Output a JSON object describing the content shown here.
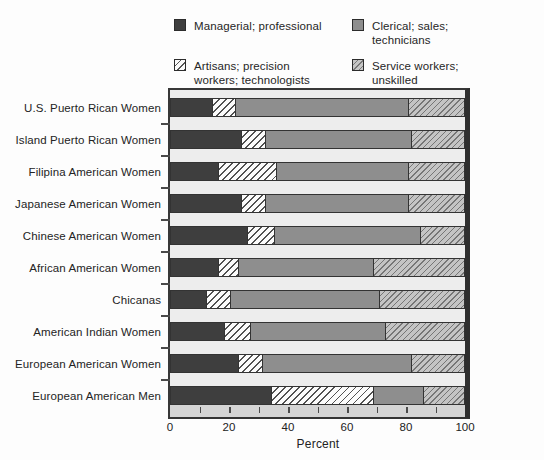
{
  "legend": {
    "items": [
      {
        "key": "managerial",
        "label": "Managerial; professional"
      },
      {
        "key": "clerical",
        "label": "Clerical; sales;\ntechnicians"
      },
      {
        "key": "artisans",
        "label": "Artisans; precision\nworkers; technologists"
      },
      {
        "key": "service",
        "label": "Service workers;\nunskilled"
      }
    ]
  },
  "chart_data": {
    "type": "bar",
    "stacked": true,
    "orientation": "horizontal",
    "xlabel": "Percent",
    "xlim": [
      0,
      100
    ],
    "x_major_ticks": [
      0,
      20,
      40,
      60,
      80,
      100
    ],
    "band_ticks": [
      10,
      20,
      30,
      40,
      50,
      60,
      70,
      80,
      90
    ],
    "grid": false,
    "legend_position": "top",
    "categories": [
      "U.S. Puerto Rican Women",
      "Island Puerto Rican Women",
      "Filipina American Women",
      "Japanese American Women",
      "Chinese American Women",
      "African American Women",
      "Chicanas",
      "American Indian Women",
      "European American Women",
      "European American Men"
    ],
    "series": [
      {
        "key": "managerial",
        "name": "Managerial; professional",
        "values": [
          14,
          24,
          16,
          24,
          26,
          16,
          12,
          18,
          23,
          34
        ]
      },
      {
        "key": "artisans",
        "name": "Artisans; precision workers; technologists",
        "values": [
          8,
          8,
          20,
          8,
          9,
          7,
          8,
          9,
          8,
          35
        ]
      },
      {
        "key": "clerical",
        "name": "Clerical; sales; technicians",
        "values": [
          59,
          50,
          45,
          49,
          50,
          46,
          51,
          46,
          51,
          17
        ]
      },
      {
        "key": "service",
        "name": "Service workers; unskilled",
        "values": [
          19,
          18,
          19,
          19,
          15,
          31,
          29,
          27,
          18,
          14
        ]
      }
    ]
  },
  "colors": {
    "managerial": "#3e3e3e",
    "clerical": "#8e8e8e",
    "artisans_bg": "#fbfbfb",
    "artisans_line": "#515151",
    "service_bg": "#c4c4c4",
    "service_line": "#767676",
    "plot_bg": "#ededed",
    "tick_band": "#d4d4d4",
    "frame_border": "#383838",
    "page_bg": "#fdfdfd"
  }
}
